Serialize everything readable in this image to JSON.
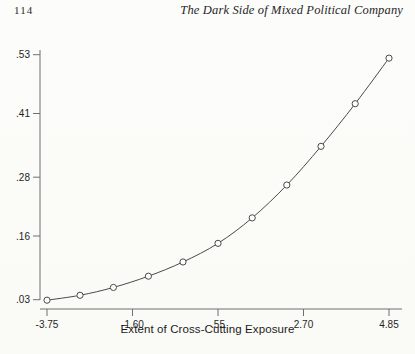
{
  "header": {
    "page_number": "114",
    "running_title": "The Dark Side of Mixed Political Company"
  },
  "figure": {
    "x_axis_title": "Extent of Cross-Cutting Exposure",
    "y_axis_title": ""
  },
  "chart_data": {
    "type": "line",
    "title": "",
    "subtitle": "",
    "xlabel": "Extent of Cross-Cutting Exposure",
    "ylabel": "",
    "xlim": [
      -4.35,
      5.25
    ],
    "ylim": [
      0.018,
      0.555
    ],
    "xticks": [
      -3.75,
      -1.6,
      0.55,
      2.7,
      4.85
    ],
    "xticklabels": [
      "-3.75",
      "-1.60",
      ".55",
      "2.70",
      "4.85"
    ],
    "yticks": [
      0.03,
      0.16,
      0.28,
      0.41,
      0.53
    ],
    "yticklabels": [
      ".03",
      ".16",
      ".28",
      ".41",
      ".53"
    ],
    "grid": false,
    "legend": false,
    "marker": "open-circle",
    "line_color": "#4a4a4a",
    "marker_color": "#4a4a4a",
    "series": [
      {
        "name": "Predicted value",
        "x": [
          -3.75,
          -2.92,
          -2.08,
          -1.2,
          -0.33,
          0.55,
          1.41,
          2.28,
          3.14,
          4.0,
          4.85
        ],
        "values": [
          0.029,
          0.039,
          0.055,
          0.078,
          0.107,
          0.145,
          0.197,
          0.264,
          0.343,
          0.43,
          0.523
        ]
      }
    ]
  }
}
